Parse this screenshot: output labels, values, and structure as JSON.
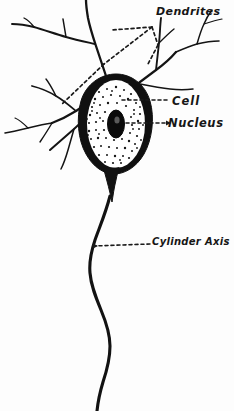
{
  "figure": {
    "background_color": "#fdfdfd",
    "ink_color": "#111111",
    "width": 234,
    "height": 411
  },
  "labels": {
    "dendrites": "Dendrites",
    "cell": "Cell",
    "nucleus": "Nucleus",
    "cylinder_axis": "Cylinder Axis"
  },
  "parts": {
    "soma_name": "cell-body-soma",
    "nucleus_name": "nucleus",
    "cytoplasm_name": "cytoplasm-stipple",
    "axon_name": "axon-cylinder-axis",
    "dendrite_name": "dendrite-branch"
  },
  "leaders": {
    "dendrites_style": "dashed",
    "cell_style": "dashed",
    "nucleus_style": "dashed-arrow",
    "cylinder_axis_style": "dashed-arrow"
  }
}
